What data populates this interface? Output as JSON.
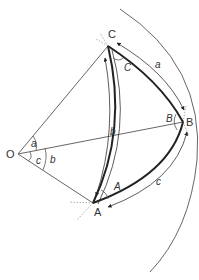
{
  "colors": {
    "line": "#555555",
    "arc": "#333333",
    "dashed": "#8a8a8a",
    "label": "#333333"
  },
  "vertices": {
    "O": {
      "label": "O",
      "x": 18,
      "y": 154
    },
    "A": {
      "label": "A",
      "x": 93,
      "y": 203
    },
    "B": {
      "label": "B",
      "x": 183,
      "y": 122
    },
    "C": {
      "label": "C",
      "x": 108,
      "y": 46
    }
  },
  "labels": {
    "vertex_O": "O",
    "vertex_A": "A",
    "vertex_B": "B",
    "vertex_C": "C",
    "angle_A": "A",
    "angle_B": "B",
    "angle_C": "C",
    "side_a": "a",
    "side_b_arc": "b",
    "side_c": "c",
    "central_a": "a",
    "central_c": "c",
    "central_b": "b"
  },
  "sides": [
    {
      "name": "a",
      "from": "C",
      "to": "B"
    },
    {
      "name": "b",
      "from": "A",
      "to": "C"
    },
    {
      "name": "c",
      "from": "A",
      "to": "B"
    }
  ]
}
